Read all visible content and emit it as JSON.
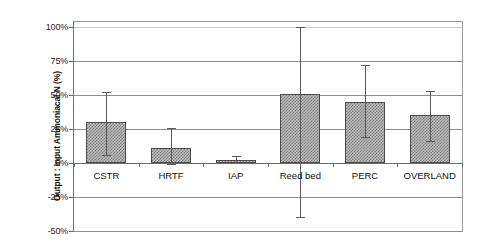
{
  "chart_data": {
    "type": "bar",
    "title": "",
    "subtitle": "",
    "xlabel": "",
    "ylabel": "Output : Input Ammoniacal N (%)",
    "categories": [
      "CSTR",
      "HRTF",
      "IAP",
      "Reed bed",
      "PERC",
      "OVERLAND"
    ],
    "values": [
      30.5,
      11,
      2,
      51,
      45,
      35
    ],
    "error_low": [
      6,
      -1,
      0,
      -40,
      19,
      16
    ],
    "error_high": [
      52,
      26,
      5,
      100,
      72,
      53
    ],
    "series": [
      {
        "name": "Output : Input Ammoniacal N",
        "values": [
          30.5,
          11,
          2,
          51,
          45,
          35
        ]
      }
    ],
    "ylim": [
      -50,
      100
    ],
    "ytick_values": [
      100,
      75,
      50,
      25,
      0,
      -25,
      -50
    ],
    "ytick_labels": [
      "100%",
      "75%",
      "50%",
      "25%",
      "0%",
      "-25%",
      "-50%"
    ],
    "grid": true,
    "grid_axis": "y",
    "legend": "none",
    "bar_fill": "#bdbdbd",
    "bar_pattern": "cross-hatch",
    "bar_edge_color": "#4a4a4a",
    "error_bar_color": "#5a5a5a",
    "grid_color": "#8d8d8d",
    "axis_color": "#6d6d6d",
    "background": "#ffffff"
  }
}
